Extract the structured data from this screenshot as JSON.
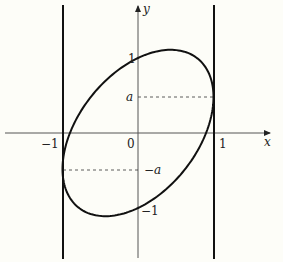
{
  "figure": {
    "type": "ellipse-between-vertical-lines",
    "background": "#fdfdf8",
    "stroke_color": "#111111",
    "axes": {
      "x_label": "x",
      "y_label": "y",
      "origin_label": "0"
    },
    "ticks": {
      "x_neg_one": "−1",
      "x_pos_one": "1",
      "y_pos_one": "1",
      "y_neg_one": "−1",
      "y_a": "a",
      "y_neg_a": "−a"
    },
    "curve": {
      "description": "Tilted ellipse x = cos t, y = a cos t + sin t",
      "a_value": 0.48
    },
    "vertical_lines": [
      {
        "x": -1
      },
      {
        "x": 1
      }
    ],
    "dashed_guides": [
      {
        "from_x": 0,
        "to_x": 1,
        "y": "a"
      },
      {
        "from_x": -1,
        "to_x": 0,
        "y": "-a"
      }
    ]
  }
}
